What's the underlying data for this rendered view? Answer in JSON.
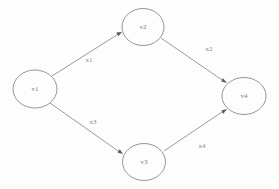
{
  "diagram": {
    "type": "directed-graph",
    "background_color": "#fdfdfd",
    "node_stroke_color": "#8a8a8a",
    "edge_color": "#8f8f8f",
    "label_color": "#7a7a7a",
    "nodes": [
      {
        "id": "v1",
        "label": "v1",
        "cx": 35,
        "cy": 89,
        "rx": 22,
        "ry": 19
      },
      {
        "id": "v2",
        "label": "v2",
        "cx": 143,
        "cy": 27,
        "rx": 21,
        "ry": 18.5
      },
      {
        "id": "v3",
        "label": "v3",
        "cx": 144,
        "cy": 162,
        "rx": 21.5,
        "ry": 18.5
      },
      {
        "id": "v4",
        "label": "v4",
        "cx": 244,
        "cy": 96,
        "rx": 22,
        "ry": 18.5
      }
    ],
    "edges": [
      {
        "id": "e1",
        "label": "x1",
        "from": "v1",
        "to": "v2",
        "x1": 52,
        "y1": 76,
        "x2": 122,
        "y2": 32,
        "label_x": 89,
        "label_y": 60
      },
      {
        "id": "e2",
        "label": "x2",
        "from": "v2",
        "to": "v4",
        "x1": 161,
        "y1": 38,
        "x2": 227,
        "y2": 83,
        "label_x": 209,
        "label_y": 49
      },
      {
        "id": "e3",
        "label": "x3",
        "from": "v1",
        "to": "v3",
        "x1": 50,
        "y1": 103,
        "x2": 123,
        "y2": 154,
        "label_x": 93,
        "label_y": 122
      },
      {
        "id": "e4",
        "label": "x4",
        "from": "v3",
        "to": "v4",
        "x1": 164,
        "y1": 151,
        "x2": 227,
        "y2": 109,
        "label_x": 202,
        "label_y": 146
      }
    ]
  }
}
